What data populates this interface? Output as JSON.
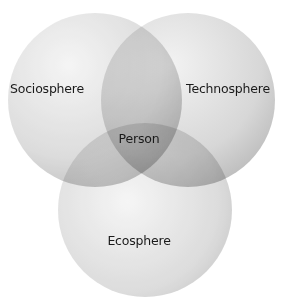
{
  "diagram": {
    "type": "venn",
    "circles": [
      {
        "id": "sociosphere",
        "label": "Sociosphere",
        "cx": 95,
        "cy": 100,
        "r": 87
      },
      {
        "id": "technosphere",
        "label": "Technosphere",
        "cx": 188,
        "cy": 100,
        "r": 87
      },
      {
        "id": "ecosphere",
        "label": "Ecosphere",
        "cx": 145,
        "cy": 210,
        "r": 87
      }
    ],
    "center_label": "Person",
    "colors": {
      "fill": "#9a9a9a",
      "text": "#1a1a1a",
      "background": "#ffffff"
    }
  }
}
